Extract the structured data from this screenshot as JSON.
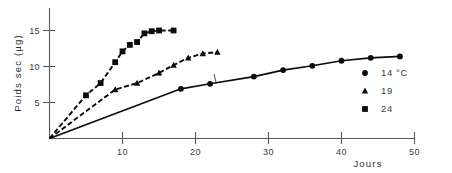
{
  "chart_data": {
    "type": "line",
    "title": "",
    "xlabel": "Jours",
    "ylabel": "Poids sec (µg)",
    "xlim": [
      0,
      52
    ],
    "ylim": [
      0,
      16.5
    ],
    "xticks": [
      10,
      20,
      30,
      40,
      50
    ],
    "xticklabels": [
      "10",
      "20",
      "30",
      "40",
      "50"
    ],
    "yticks": [
      5,
      10,
      15
    ],
    "yticklabels": [
      "5",
      "10",
      "15"
    ],
    "grid": false,
    "legend_position": "right",
    "series": [
      {
        "name": "14 °C",
        "marker": "circle",
        "linestyle": "solid",
        "x": [
          0,
          18,
          22,
          28,
          32,
          36,
          40,
          44,
          48
        ],
        "y": [
          0,
          6.9,
          7.6,
          8.6,
          9.5,
          10.1,
          10.8,
          11.2,
          11.4
        ]
      },
      {
        "name": "19",
        "marker": "triangle",
        "linestyle": "dashed",
        "x": [
          0,
          9,
          12,
          15,
          17,
          19,
          21,
          23
        ],
        "y": [
          0,
          6.8,
          7.7,
          9.1,
          10.2,
          11.2,
          11.8,
          12.0
        ]
      },
      {
        "name": "24",
        "marker": "square",
        "linestyle": "dashed",
        "x": [
          0,
          5,
          7,
          9,
          10,
          11,
          12,
          13,
          14,
          15,
          17
        ],
        "y": [
          0,
          6.0,
          7.7,
          10.6,
          12.1,
          13.0,
          13.4,
          14.6,
          14.9,
          15.0,
          15.0
        ]
      }
    ]
  },
  "legend": {
    "entries": [
      {
        "label": "14 °C",
        "marker": "circle-marker"
      },
      {
        "label": "19",
        "marker": "triangle-marker"
      },
      {
        "label": "24",
        "marker": "square-marker"
      }
    ]
  },
  "axes": {
    "y_title": "Poids sec (µg)",
    "x_title": "Jours"
  }
}
